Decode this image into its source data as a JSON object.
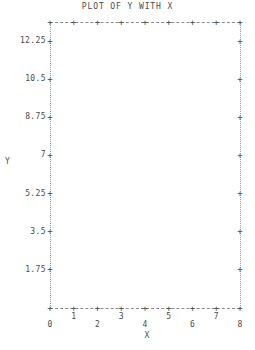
{
  "chart_data": {
    "type": "scatter",
    "title": "PLOT OF Y WITH X",
    "xlabel": "X",
    "ylabel": "Y",
    "grid": false,
    "legend": null,
    "frame": "dotted-box-with-plus-ticks",
    "xlim": [
      0,
      8
    ],
    "ylim": [
      0,
      13.125
    ],
    "x_ticks": [
      0,
      1,
      2,
      3,
      4,
      5,
      6,
      7,
      8
    ],
    "x_tick_labels": [
      "0",
      "1",
      "2",
      "3",
      "4",
      "5",
      "6",
      "7",
      "8"
    ],
    "y_ticks": [
      1.75,
      3.5,
      5.25,
      7,
      8.75,
      10.5,
      12.25
    ],
    "y_tick_labels": [
      "1.75",
      "3.5",
      "5.25",
      "7",
      "8.75",
      "10.5",
      "12.25"
    ],
    "series": [
      {
        "name": "Y",
        "x": [],
        "y": []
      }
    ],
    "annotations": []
  },
  "plot": {
    "title": "PLOT OF Y WITH X",
    "axis_titles": {
      "y": "Y",
      "x": "X"
    },
    "tick_glyph": "+",
    "y_axis": {
      "labels": [
        "12.25",
        "10.5",
        "8.75",
        "7",
        "5.25",
        "3.5",
        "1.75"
      ],
      "values": [
        12.25,
        10.5,
        8.75,
        7,
        5.25,
        3.5,
        1.75
      ]
    },
    "x_axis": {
      "labels": [
        "0",
        "1",
        "2",
        "3",
        "4",
        "5",
        "6",
        "7",
        "8"
      ],
      "values": [
        0,
        1,
        2,
        3,
        4,
        5,
        6,
        7,
        8
      ]
    },
    "colors": {
      "ink": "#4a4a4a",
      "rule": "#8a8a8a",
      "background": "#ffffff"
    }
  }
}
